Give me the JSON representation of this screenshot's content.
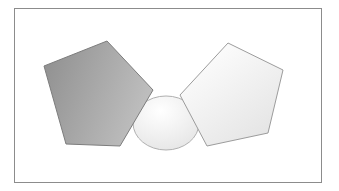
{
  "figure": {
    "width": 339,
    "height": 191,
    "background_color": "#ffffff",
    "title": ""
  },
  "frame": {
    "name": "panel-border",
    "x": 14,
    "y": 8,
    "width": 308,
    "height": 175,
    "stroke_color": "#8c8c8c",
    "stroke_width": 1,
    "fill_color": "#ffffff"
  },
  "shapes": [
    {
      "id": "center-ellipse",
      "label": "Ellipse",
      "type": "ellipse",
      "cx": 166,
      "cy": 123,
      "rx": 33,
      "ry": 27,
      "fill_start": "#ffffff",
      "fill_end": "#e3e3e3",
      "stroke_color": "#b0b0b0",
      "stroke_width": 1,
      "z": 1
    },
    {
      "id": "left-pentagon",
      "label": "Left Pentagon",
      "type": "pentagon",
      "points": "107,41 44,65 51,131 66,143 120,146 153,90",
      "polygon": "107,41 44,66 66,144 120,146 153,90",
      "fill_start": "#8e8e8e",
      "fill_end": "#bdbdbd",
      "stroke_color": "#7d7d7d",
      "stroke_width": 1,
      "z": 2
    },
    {
      "id": "right-pentagon",
      "label": "Right Pentagon",
      "type": "pentagon",
      "polygon": "228,43 283,70 268,133 207,146 180,95",
      "fill_start": "#ffffff",
      "fill_end": "#e2e2e2",
      "stroke_color": "#9c9c9c",
      "stroke_width": 1,
      "z": 3
    }
  ],
  "palette": {
    "background": "#ffffff",
    "frame_stroke": "#8c8c8c",
    "dark_gray": "#8e8e8e",
    "mid_gray": "#bdbdbd",
    "light_gray": "#e2e2e2",
    "near_white": "#ffffff"
  }
}
